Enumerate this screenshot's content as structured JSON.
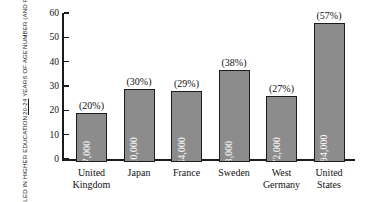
{
  "chart_data": {
    "type": "bar",
    "title": "",
    "xlabel": "",
    "ylabel": "NUMBER (AND PERCENT) OF PERSONS 20-24 YEARS OF AGE ENROLLED IN HIGHER EDUCATION",
    "ylabel_lines": [
      "NUMBER (AND PERCENT) OF PERSONS",
      "20-24 YEARS OF AGE",
      "ENROLLED IN HIGHER EDUCATION"
    ],
    "ylabel_line2_underlined": "20-24",
    "ylabel_line2_rest": " YEARS OF AGE",
    "ylim": [
      0,
      60
    ],
    "ytick_values": [
      0,
      10,
      20,
      30,
      40,
      50,
      60
    ],
    "ytick_labels": [
      "0",
      "10",
      "20",
      "30",
      "40",
      "50",
      "60"
    ],
    "grid": false,
    "legend": false,
    "categories": [
      "United Kingdom",
      "Japan",
      "France",
      "Sweden",
      "West Germany",
      "United States"
    ],
    "category_lines": [
      [
        "United",
        "Kingdom"
      ],
      [
        "Japan"
      ],
      [
        "France"
      ],
      [
        "Sweden"
      ],
      [
        "West",
        "Germany"
      ],
      [
        "United",
        "States"
      ]
    ],
    "values": [
      20,
      30,
      29,
      38,
      27,
      57
    ],
    "value_labels": [
      "(20%)",
      "(30%)",
      "(29%)",
      "(38%)",
      "(27%)",
      "(57%)"
    ],
    "bar_inner_labels": [
      "897,000",
      "2,410,000",
      "1,144,000",
      "223,000",
      "1,472,000",
      "12,394,000"
    ],
    "counts": [
      897000,
      2410000,
      1144000,
      223000,
      1472000,
      12394000
    ],
    "colors": {
      "bar_fill": "#8c8c8c",
      "bar_border": "#1c1c1c",
      "axis": "#1a1a1a",
      "text": "#111111",
      "bar_value_text": "#ffffff",
      "background": "#ffffff"
    }
  }
}
